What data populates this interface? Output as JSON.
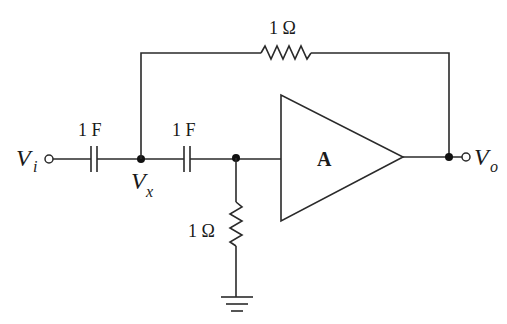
{
  "diagram": {
    "type": "circuit",
    "title": "",
    "components": {
      "input_capacitor": {
        "label": "1 F",
        "kind": "capacitor"
      },
      "series_capacitor": {
        "label": "1 F",
        "kind": "capacitor"
      },
      "feedback_resistor": {
        "label": "1 Ω",
        "kind": "resistor"
      },
      "shunt_resistor": {
        "label": "1 Ω",
        "kind": "resistor"
      },
      "amplifier": {
        "label": "A",
        "kind": "amplifier"
      },
      "ground": {
        "kind": "ground"
      }
    },
    "nodes": {
      "input": {
        "label": "V",
        "subscript": "i"
      },
      "middle": {
        "label": "V",
        "subscript": "x"
      },
      "output": {
        "label": "V",
        "subscript": "o"
      }
    },
    "colors": {
      "line": "#2a2a2a",
      "background": "#ffffff"
    }
  }
}
